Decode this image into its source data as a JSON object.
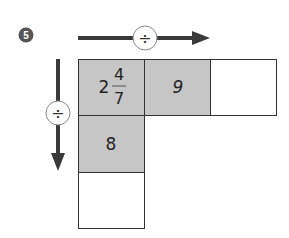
{
  "problem": {
    "number": "5"
  },
  "operators": {
    "horizontal": {
      "symbol": "÷",
      "direction": "right"
    },
    "vertical": {
      "symbol": "÷",
      "direction": "down"
    }
  },
  "grid": {
    "cells": [
      {
        "id": "r0c0",
        "whole": "2",
        "numerator": "4",
        "denominator": "7",
        "shaded": true
      },
      {
        "id": "r0c1",
        "value": "9",
        "shaded": true
      },
      {
        "id": "r0c2",
        "value": "",
        "shaded": false
      },
      {
        "id": "r1c0",
        "value": "8",
        "shaded": true
      },
      {
        "id": "r2c0",
        "value": "",
        "shaded": false
      }
    ]
  },
  "colors": {
    "shaded_cell": "#c6c6c6",
    "empty_cell": "#ffffff",
    "border": "#333333",
    "arrow": "#3a3a3a",
    "badge": "#555555"
  }
}
